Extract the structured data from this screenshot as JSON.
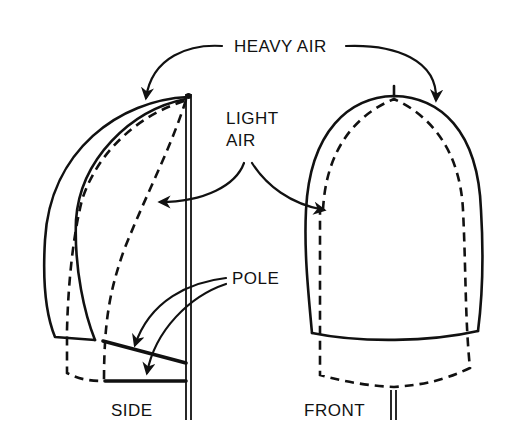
{
  "diagram": {
    "labels": {
      "heavy_air": "HEAVY AIR",
      "light_air_line1": "LIGHT",
      "light_air_line2": "AIR",
      "pole": "POLE",
      "side": "SIDE",
      "front": "FRONT"
    },
    "views": [
      {
        "name": "side",
        "caption": "SIDE"
      },
      {
        "name": "front",
        "caption": "FRONT"
      }
    ],
    "colors": {
      "ink": "#111111",
      "background": "#ffffff"
    }
  }
}
